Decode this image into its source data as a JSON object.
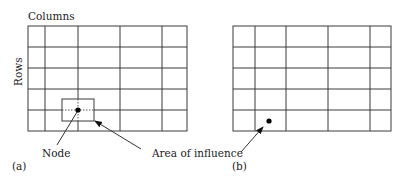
{
  "labels": {
    "columns": "Columns",
    "rows": "Rows",
    "node": "Node",
    "area_of_influence": "Area of influence",
    "panel_a": "(a)",
    "panel_b": "(b)"
  },
  "grids": [
    {
      "name": "grid-a",
      "rows": 5,
      "columns": 5,
      "has_node": true,
      "has_area_of_influence": true
    },
    {
      "name": "grid-b",
      "rows": 5,
      "columns": 5,
      "has_node": true,
      "has_area_of_influence": false
    }
  ],
  "colors": {
    "line": "#3a3a3a",
    "node": "#000000",
    "text": "#222222"
  }
}
